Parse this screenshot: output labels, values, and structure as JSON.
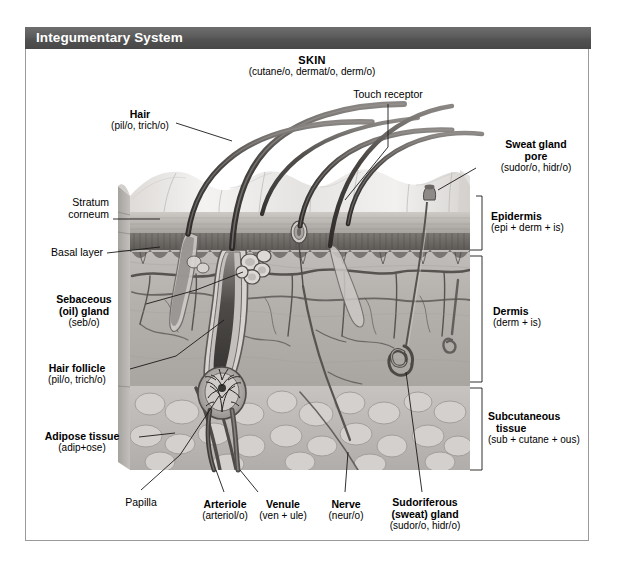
{
  "header": {
    "title": "Integumentary System"
  },
  "figure": {
    "main_caption": {
      "term": "SKIN",
      "roots": "(cutane/o, dermat/o, derm/o)"
    },
    "labels": [
      {
        "id": "hair",
        "term": "Hair",
        "roots": "(pil/o, trich/o)",
        "bold": true
      },
      {
        "id": "touch_receptor",
        "term": "Touch receptor",
        "roots": "",
        "bold": false
      },
      {
        "id": "sweat_gland_pore",
        "term": "Sweat gland",
        "term2": "pore",
        "roots": "(sudor/o, hidr/o)",
        "bold": true
      },
      {
        "id": "stratum_corneum",
        "term": "Stratum",
        "term2": "corneum",
        "roots": "",
        "bold": false
      },
      {
        "id": "basal_layer",
        "term": "Basal layer",
        "roots": "",
        "bold": false
      },
      {
        "id": "epidermis",
        "term": "Epidermis",
        "roots": "(epi + derm + is)",
        "bold": true
      },
      {
        "id": "dermis",
        "term": "Dermis",
        "roots": "(derm + is)",
        "bold": true
      },
      {
        "id": "subcutaneous_tissue",
        "term": "Subcutaneous",
        "term2": "tissue",
        "roots": "(sub + cutane + ous)",
        "bold": true
      },
      {
        "id": "sebaceous_gland",
        "term": "Sebaceous",
        "term2": "(oil) gland",
        "roots": "(seb/o)",
        "bold": true
      },
      {
        "id": "hair_follicle",
        "term": "Hair follicle",
        "roots": "(pil/o, trich/o)",
        "bold": true
      },
      {
        "id": "adipose_tissue",
        "term": "Adipose tissue",
        "roots": "(adip+ose)",
        "bold": true
      },
      {
        "id": "papilla",
        "term": "Papilla",
        "roots": "",
        "bold": false
      },
      {
        "id": "arteriole",
        "term": "Arteriole",
        "roots": "(arteriol/o)",
        "bold": true
      },
      {
        "id": "venule",
        "term": "Venule",
        "roots": "(ven + ule)",
        "bold": true
      },
      {
        "id": "nerve",
        "term": "Nerve",
        "roots": "(neur/o)",
        "bold": true
      },
      {
        "id": "sudoriferous_gland",
        "term": "Sudoriferous",
        "term2": "(sweat) gland",
        "roots": "(sudor/o, hidr/o)",
        "bold": true
      }
    ],
    "layer_brackets": [
      {
        "id": "epidermis-bracket",
        "label": "Epidermis"
      },
      {
        "id": "dermis-bracket",
        "label": "Dermis"
      },
      {
        "id": "subcutaneous-bracket",
        "label": "Subcutaneous tissue"
      }
    ]
  },
  "colors": {
    "title_bar": "#585858",
    "title_text": "#ffffff",
    "frame_border": "#9a9a9a",
    "label_text": "#000000",
    "leader_line": "#1a1a1a",
    "epidermis_surface": "#e2e0de",
    "stratum_corneum": "#b9b6b2",
    "basal_layer": "#6e6a66",
    "dermis": "#b3b0ad",
    "subcutaneous": "#c9c6c3",
    "vessel_dark": "#4a4744",
    "hair_shaft": "#555250"
  }
}
